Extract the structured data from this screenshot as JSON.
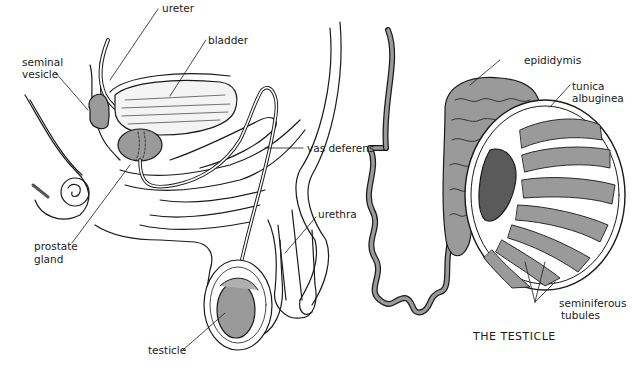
{
  "diagram": {
    "left_panel": {
      "labels": {
        "ureter": "ureter",
        "seminal_vesicle_1": "seminal",
        "seminal_vesicle_2": "vesicle",
        "bladder": "bladder",
        "vas_deferens": "vas deferens",
        "urethra": "urethra",
        "prostate_gland_1": "prostate",
        "prostate_gland_2": "gland",
        "testicle": "testicle"
      }
    },
    "right_panel": {
      "title": "THE TESTICLE",
      "labels": {
        "epididymis": "epididymis",
        "tunica_albuginea_1": "tunica",
        "tunica_albuginea_2": "albuginea",
        "seminiferous_tubules_1": "seminiferous",
        "seminiferous_tubules_2": "tubules"
      }
    },
    "colors": {
      "background": "#ffffff",
      "line": "#1a1a1a",
      "fill_gray": "#9a9a9a",
      "fill_light": "#c8c8c8"
    }
  }
}
